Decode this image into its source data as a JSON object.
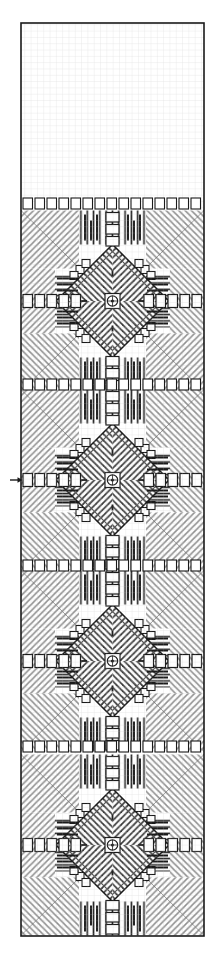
{
  "document": {
    "type": "needlework-chart",
    "title": "Embroidery Band Pattern Chart",
    "description": "Monochrome counted-thread band sampler chart with repeating diamond star motifs",
    "background_color": "#ffffff",
    "ink_color": "#1a1a1a",
    "light_ink_color": "#8c8c8c",
    "grid_line_color": "#b4b4b4"
  },
  "canvas": {
    "width": 222,
    "height": 966
  },
  "chart_area": {
    "left": 21,
    "top": 23,
    "right": 204,
    "bottom": 936,
    "cell_size": 6.31,
    "columns": 29,
    "rows": 145,
    "border_width": 1.6,
    "border_color": "#1a1a1a"
  },
  "markers": [
    {
      "name": "center-row-arrow",
      "glyph": "arrow-right",
      "x": 10,
      "y": 480,
      "length": 11,
      "color": "#1a1a1a",
      "meaning": "center row indicator"
    }
  ],
  "chart_data": {
    "type": "heatmap",
    "title": "Embroidery Band Pattern Chart",
    "xlabel": "",
    "ylabel": "",
    "grid": true,
    "legend_position": "none",
    "columns": 29,
    "rows": 145,
    "motif": {
      "name": "diamond-star",
      "repeat_height_px": 181,
      "repeat_count": 5,
      "centers_y": [
        120,
        301,
        480,
        661,
        845
      ],
      "center_x": 112.5
    },
    "symbol_legend": [
      {
        "key": "diag_fill",
        "label": "diagonal hatched filling stitch",
        "color": "#8c8c8c"
      },
      {
        "key": "satin_vertical",
        "label": "vertical satin stitch bar",
        "color": "#1a1a1a"
      },
      {
        "key": "satin_horizontal",
        "label": "horizontal satin stitch bar",
        "color": "#1a1a1a"
      },
      {
        "key": "kloster_block",
        "label": "kloster block / square eyelet",
        "color": "#1a1a1a"
      },
      {
        "key": "open_square",
        "label": "cut / withdrawn open square",
        "color": "#ffffff"
      },
      {
        "key": "center_eyelet",
        "label": "centre eyelet ring",
        "color": "#1a1a1a"
      }
    ],
    "bands": [
      {
        "index": 1,
        "y_top": 23,
        "y_bottom": 210,
        "motif": "diamond-star"
      },
      {
        "index": 2,
        "y_top": 210,
        "y_bottom": 391,
        "motif": "diamond-star"
      },
      {
        "index": 3,
        "y_top": 391,
        "y_bottom": 572,
        "motif": "diamond-star"
      },
      {
        "index": 4,
        "y_top": 572,
        "y_bottom": 753,
        "motif": "diamond-star"
      },
      {
        "index": 5,
        "y_top": 753,
        "y_bottom": 936,
        "motif": "diamond-star"
      }
    ]
  }
}
